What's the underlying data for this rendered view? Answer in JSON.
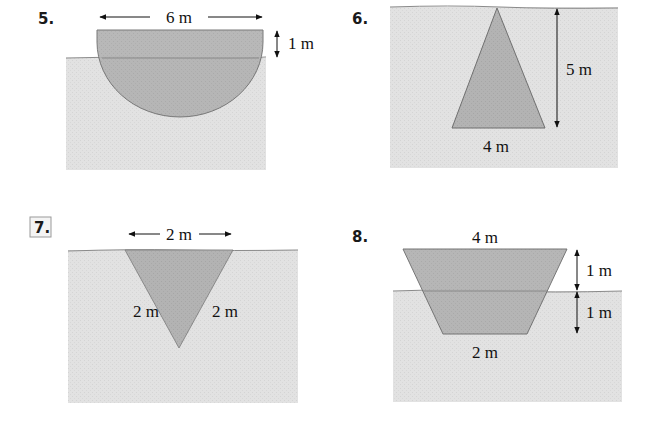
{
  "colors": {
    "water": "#e2e2e2",
    "water_line": "#8a8a8a",
    "plate": "#b3b3b3",
    "plate_edge": "#6f6f6f",
    "ink": "#111111",
    "label_box": "#9a9a9a"
  },
  "figures": [
    {
      "number": "5.",
      "shape": "semicircle",
      "labels": {
        "width": "6 m",
        "above_water": "1 m"
      }
    },
    {
      "number": "6.",
      "shape": "triangle-apex-up",
      "labels": {
        "height": "5 m",
        "base": "4 m"
      }
    },
    {
      "number": "7.",
      "boxed": true,
      "shape": "triangle-apex-down",
      "labels": {
        "top": "2 m",
        "left_side": "2 m",
        "right_side": "2 m"
      }
    },
    {
      "number": "8.",
      "shape": "trapezoid",
      "labels": {
        "top": "4 m",
        "above_water": "1 m",
        "below_water": "1 m",
        "bottom": "2 m"
      }
    }
  ]
}
